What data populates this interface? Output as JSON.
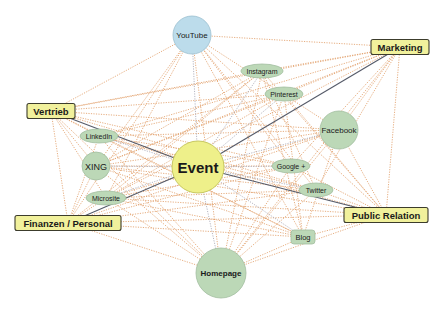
{
  "diagram": {
    "colors": {
      "background": "#ffffff",
      "center_fill": "#eef08a",
      "center_stroke": "#c8c860",
      "category_fill": "#f1f19c",
      "category_stroke": "#3c3c2c",
      "channel_fill": "#bcd8b7",
      "channel_stroke": "#a2bea0",
      "youtube_fill": "#bcdceb",
      "youtube_stroke": "#9bbfcf",
      "edge_orange": "#e2a06b",
      "edge_gray": "#a9a9b6",
      "edge_dark": "#555a68"
    },
    "nodes": {
      "event": {
        "label": "Event",
        "type": "center-circle",
        "x": 198,
        "y": 167,
        "r": 26
      },
      "marketing": {
        "label": "Marketing",
        "type": "category-box",
        "x": 400,
        "y": 47,
        "w": 58,
        "h": 15
      },
      "vertrieb": {
        "label": "Vertrieb",
        "type": "category-box",
        "x": 51,
        "y": 111,
        "w": 48,
        "h": 15
      },
      "finanzen": {
        "label": "Finanzen / Personal",
        "type": "category-box",
        "x": 68,
        "y": 223,
        "w": 106,
        "h": 15
      },
      "public_relation": {
        "label": "Public Relation",
        "type": "category-box",
        "x": 386,
        "y": 215,
        "w": 84,
        "h": 15
      },
      "youtube": {
        "label": "YouTube",
        "type": "circle",
        "x": 192,
        "y": 35,
        "r": 19
      },
      "facebook": {
        "label": "Facebook",
        "type": "circle",
        "x": 339,
        "y": 130,
        "r": 19
      },
      "xing": {
        "label": "XING",
        "type": "circle",
        "x": 96,
        "y": 166,
        "r": 14
      },
      "homepage": {
        "label": "Homepage",
        "type": "circle",
        "x": 221,
        "y": 273,
        "r": 25
      },
      "instagram": {
        "label": "Instagram",
        "type": "ellipse",
        "x": 262,
        "y": 71,
        "rx": 21,
        "ry": 7
      },
      "pinterest": {
        "label": "Pinterest",
        "type": "ellipse",
        "x": 284,
        "y": 94,
        "rx": 19,
        "ry": 7
      },
      "linkedin": {
        "label": "LinkedIn",
        "type": "ellipse",
        "x": 99,
        "y": 136,
        "rx": 19,
        "ry": 7
      },
      "google_plus": {
        "label": "Google +",
        "type": "ellipse",
        "x": 291,
        "y": 166,
        "rx": 19,
        "ry": 7
      },
      "microsite": {
        "label": "Microsite",
        "type": "ellipse",
        "x": 106,
        "y": 198,
        "rx": 20,
        "ry": 7
      },
      "twitter": {
        "label": "Twitter",
        "type": "ellipse",
        "x": 316,
        "y": 190,
        "rx": 17,
        "ry": 7
      },
      "blog": {
        "label": "Blog",
        "type": "rounded-box",
        "x": 303,
        "y": 237,
        "w": 24,
        "h": 14
      }
    },
    "edges": {
      "dark": [
        [
          "event",
          "vertrieb"
        ],
        [
          "event",
          "public_relation"
        ],
        [
          "event",
          "finanzen"
        ],
        [
          "event",
          "marketing"
        ]
      ],
      "gray": [
        [
          "event",
          "homepage"
        ],
        [
          "event",
          "xing"
        ],
        [
          "event",
          "google_plus"
        ],
        [
          "event",
          "youtube"
        ],
        [
          "event",
          "linkedin"
        ],
        [
          "event",
          "microsite"
        ],
        [
          "event",
          "facebook"
        ],
        [
          "event",
          "twitter"
        ],
        [
          "event",
          "blog"
        ],
        [
          "event",
          "pinterest"
        ],
        [
          "event",
          "instagram"
        ]
      ],
      "orange": [
        [
          "marketing",
          "youtube"
        ],
        [
          "marketing",
          "instagram"
        ],
        [
          "marketing",
          "pinterest"
        ],
        [
          "marketing",
          "facebook"
        ],
        [
          "marketing",
          "google_plus"
        ],
        [
          "marketing",
          "twitter"
        ],
        [
          "marketing",
          "linkedin"
        ],
        [
          "marketing",
          "xing"
        ],
        [
          "marketing",
          "public_relation"
        ],
        [
          "marketing",
          "homepage"
        ],
        [
          "marketing",
          "microsite"
        ],
        [
          "marketing",
          "vertrieb"
        ],
        [
          "vertrieb",
          "youtube"
        ],
        [
          "vertrieb",
          "instagram"
        ],
        [
          "vertrieb",
          "pinterest"
        ],
        [
          "vertrieb",
          "facebook"
        ],
        [
          "vertrieb",
          "linkedin"
        ],
        [
          "vertrieb",
          "xing"
        ],
        [
          "vertrieb",
          "microsite"
        ],
        [
          "vertrieb",
          "homepage"
        ],
        [
          "vertrieb",
          "google_plus"
        ],
        [
          "vertrieb",
          "twitter"
        ],
        [
          "vertrieb",
          "finanzen"
        ],
        [
          "vertrieb",
          "blog"
        ],
        [
          "finanzen",
          "youtube"
        ],
        [
          "finanzen",
          "linkedin"
        ],
        [
          "finanzen",
          "xing"
        ],
        [
          "finanzen",
          "microsite"
        ],
        [
          "finanzen",
          "homepage"
        ],
        [
          "finanzen",
          "facebook"
        ],
        [
          "finanzen",
          "twitter"
        ],
        [
          "finanzen",
          "public_relation"
        ],
        [
          "finanzen",
          "instagram"
        ],
        [
          "finanzen",
          "blog"
        ],
        [
          "finanzen",
          "google_plus"
        ],
        [
          "public_relation",
          "youtube"
        ],
        [
          "public_relation",
          "facebook"
        ],
        [
          "public_relation",
          "twitter"
        ],
        [
          "public_relation",
          "google_plus"
        ],
        [
          "public_relation",
          "blog"
        ],
        [
          "public_relation",
          "homepage"
        ],
        [
          "public_relation",
          "linkedin"
        ],
        [
          "public_relation",
          "xing"
        ],
        [
          "public_relation",
          "microsite"
        ],
        [
          "public_relation",
          "instagram"
        ],
        [
          "public_relation",
          "pinterest"
        ],
        [
          "youtube",
          "facebook"
        ],
        [
          "youtube",
          "homepage"
        ],
        [
          "youtube",
          "xing"
        ],
        [
          "youtube",
          "microsite"
        ],
        [
          "youtube",
          "twitter"
        ],
        [
          "youtube",
          "blog"
        ],
        [
          "youtube",
          "google_plus"
        ],
        [
          "homepage",
          "facebook"
        ],
        [
          "homepage",
          "instagram"
        ],
        [
          "homepage",
          "pinterest"
        ],
        [
          "homepage",
          "linkedin"
        ],
        [
          "homepage",
          "xing"
        ],
        [
          "homepage",
          "microsite"
        ],
        [
          "homepage",
          "twitter"
        ],
        [
          "homepage",
          "google_plus"
        ],
        [
          "homepage",
          "blog"
        ],
        [
          "facebook",
          "linkedin"
        ],
        [
          "facebook",
          "xing"
        ],
        [
          "facebook",
          "microsite"
        ],
        [
          "facebook",
          "blog"
        ],
        [
          "instagram",
          "xing"
        ],
        [
          "instagram",
          "microsite"
        ],
        [
          "instagram",
          "blog"
        ],
        [
          "instagram",
          "twitter"
        ],
        [
          "pinterest",
          "linkedin"
        ],
        [
          "pinterest",
          "microsite"
        ],
        [
          "pinterest",
          "blog"
        ],
        [
          "pinterest",
          "xing"
        ],
        [
          "linkedin",
          "twitter"
        ],
        [
          "linkedin",
          "google_plus"
        ],
        [
          "linkedin",
          "blog"
        ],
        [
          "xing",
          "twitter"
        ],
        [
          "xing",
          "blog"
        ],
        [
          "xing",
          "google_plus"
        ],
        [
          "microsite",
          "twitter"
        ],
        [
          "microsite",
          "blog"
        ],
        [
          "microsite",
          "google_plus"
        ]
      ]
    }
  }
}
